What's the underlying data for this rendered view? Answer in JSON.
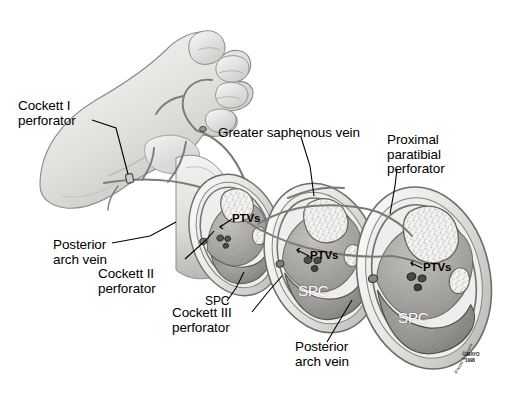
{
  "figure": {
    "background_color": "#ffffff",
    "ink_color": "#000000",
    "style": "grayscale medical line-and-wash illustration"
  },
  "labels": {
    "cockett_1": "Cockett I\nperforator",
    "greater_saphenous": "Greater saphenous vein",
    "proximal_paratibial": "Proximal\nparatibial\nperforator",
    "posterior_arch_left": "Posterior\narch vein",
    "cockett_2": "Cockett II\nperforator",
    "cockett_3": "Cockett III\nperforator",
    "posterior_arch_right": "Posterior\narch vein",
    "spc_leader": "SPC",
    "ptvs_1": "PTVs",
    "ptvs_2": "PTVs",
    "ptvs_3": "PTVs",
    "spc_mid": "SPC",
    "spc_large": "SPC"
  },
  "credit": {
    "copyright": "© MAYO",
    "year": "1998",
    "artist": "Pardo & Moore"
  },
  "abbreviations": {
    "SPC": "superficial posterior compartment",
    "PTVs": "posterior tibial veins"
  },
  "anatomy": {
    "sections": [
      {
        "name": "distal-cross-section",
        "order": 1,
        "size": "small"
      },
      {
        "name": "mid-cross-section",
        "order": 2,
        "size": "medium"
      },
      {
        "name": "proximal-cross-section",
        "order": 3,
        "size": "large"
      }
    ],
    "structures": [
      "foot",
      "medial malleolus",
      "tibia",
      "fibula",
      "soleus muscle",
      "gastrocnemius"
    ]
  },
  "palette": {
    "skin_light": "#f2f1ef",
    "skin_mid": "#d9d7d4",
    "skin_shade": "#b9b7b4",
    "vein_line": "#6f6d6b",
    "muscle_dark": "#8e8c89",
    "muscle_mid": "#a8a6a3",
    "bone_light": "#ececec",
    "outline": "#4a4846"
  }
}
